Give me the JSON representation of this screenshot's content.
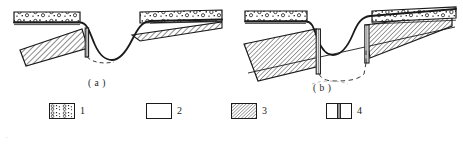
{
  "figure": {
    "panels": [
      {
        "id": "a",
        "caption": "( a )",
        "description": "Cross-section showing slip surface intersecting a single anti-slide pile at the upper slope break",
        "elements": {
          "surface_layer": "gravelly-soil-layer",
          "slide_body": "hatched-sliding-mass",
          "pile_count": 1,
          "slip_surface_style": "dashed"
        }
      },
      {
        "id": "b",
        "caption": "( b )",
        "description": "Cross-section showing slip surface intersecting two anti-slide piles across the gully",
        "elements": {
          "surface_layer": "gravelly-soil-layer",
          "slide_body": "hatched-sliding-mass",
          "pile_count": 2,
          "slip_surface_style": "dashed"
        }
      }
    ],
    "legend": {
      "items": [
        {
          "key": "1",
          "label": "1",
          "swatch": "gravel-soil-pattern-swatch"
        },
        {
          "key": "2",
          "label": "2",
          "swatch": "blank-white-swatch"
        },
        {
          "key": "3",
          "label": "3",
          "swatch": "diagonal-hatch-swatch"
        },
        {
          "key": "4",
          "label": "4",
          "swatch": "pile-section-swatch"
        }
      ]
    },
    "footer_note": "",
    "corner_mark": "."
  },
  "colors": {
    "stroke": "#1a1a1a",
    "hatch": "#2b2b2b",
    "background": "#ffffff",
    "dashed": "#3a3a3a",
    "faint_text": "#d8d8d8"
  }
}
